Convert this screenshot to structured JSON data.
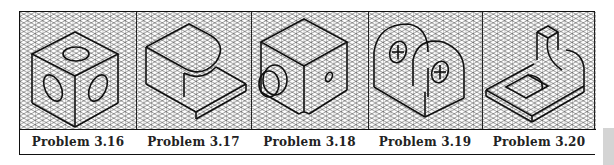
{
  "figure": {
    "panels": [
      {
        "id": "3.16",
        "caption": "Problem 3.16",
        "subject": "cube with circular holes on three faces"
      },
      {
        "id": "3.17",
        "caption": "Problem 3.17",
        "subject": "rounded block on base plate"
      },
      {
        "id": "3.18",
        "caption": "Problem 3.18",
        "subject": "block with cylindrical boss and small hole"
      },
      {
        "id": "3.19",
        "caption": "Problem 3.19",
        "subject": "two arched uprights with holes"
      },
      {
        "id": "3.20",
        "caption": "Problem 3.20",
        "subject": "base plate with slot and rounded upright"
      }
    ],
    "grid": "isometric",
    "line_color": "#111111",
    "grid_color": "#3a3a3a",
    "side_tab_color": "#d4d4d4"
  }
}
